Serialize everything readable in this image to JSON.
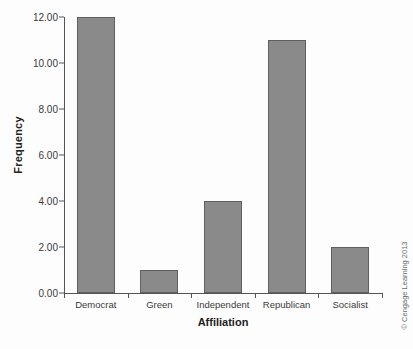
{
  "chart_data": {
    "type": "bar",
    "title": "",
    "xlabel": "Affiliation",
    "ylabel": "Frequency",
    "categories": [
      "Democrat",
      "Green",
      "Independent",
      "Republican",
      "Socialist"
    ],
    "values": [
      12,
      1,
      4,
      11,
      2
    ],
    "ylim": [
      0,
      12
    ],
    "ytick_values": [
      0,
      2,
      4,
      6,
      8,
      10,
      12
    ],
    "ytick_labels": [
      "0.00",
      "2.00",
      "4.00",
      "6.00",
      "8.00",
      "10.00",
      "12.00"
    ],
    "grid": false,
    "legend": "none",
    "series": [
      {
        "name": "Frequency",
        "values": [
          12,
          1,
          4,
          11,
          2
        ]
      }
    ]
  },
  "style": {
    "bar_fill": "#8a8a8a",
    "bar_edge": "#5f5f5f",
    "axis_color": "#555555",
    "text_color": "#3a3a3a",
    "title_color": "#222222",
    "background": "#fdfdfd"
  },
  "attribution": {
    "text": "© Cengage Learning 2013"
  }
}
